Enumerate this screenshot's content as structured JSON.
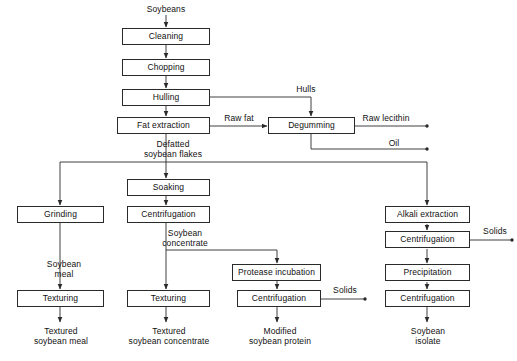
{
  "diagram": {
    "stroke_color": "#2a2a2a",
    "text_color": "#111111",
    "background": "#ffffff",
    "nodes": [
      {
        "id": "cleaning",
        "label": "Cleaning",
        "x": 122,
        "y": 28,
        "w": 88,
        "h": 17
      },
      {
        "id": "chopping",
        "label": "Chopping",
        "x": 122,
        "y": 59,
        "w": 88,
        "h": 17
      },
      {
        "id": "hulling",
        "label": "Hulling",
        "x": 122,
        "y": 89,
        "w": 88,
        "h": 17
      },
      {
        "id": "fat-extraction",
        "label": "Fat extraction",
        "x": 117,
        "y": 117,
        "w": 93,
        "h": 17
      },
      {
        "id": "degumming",
        "label": "Degumming",
        "x": 268,
        "y": 117,
        "w": 87,
        "h": 17
      },
      {
        "id": "soaking",
        "label": "Soaking",
        "x": 127,
        "y": 179,
        "w": 83,
        "h": 17
      },
      {
        "id": "grinding",
        "label": "Grinding",
        "x": 17,
        "y": 206,
        "w": 87,
        "h": 17
      },
      {
        "id": "centrifugation-mid",
        "label": "Centrifugation",
        "x": 127,
        "y": 206,
        "w": 83,
        "h": 17
      },
      {
        "id": "alkali-extraction",
        "label": "Alkali extraction",
        "x": 385,
        "y": 206,
        "w": 85,
        "h": 17
      },
      {
        "id": "centrifugation-r1",
        "label": "Centrifugation",
        "x": 385,
        "y": 231,
        "w": 85,
        "h": 17
      },
      {
        "id": "protease-incubation",
        "label": "Protease incubation",
        "x": 232,
        "y": 264,
        "w": 89,
        "h": 17
      },
      {
        "id": "precipitation",
        "label": "Precipitation",
        "x": 385,
        "y": 264,
        "w": 85,
        "h": 17
      },
      {
        "id": "texturing-left",
        "label": "Texturing",
        "x": 17,
        "y": 290,
        "w": 87,
        "h": 17
      },
      {
        "id": "texturing-mid",
        "label": "Texturing",
        "x": 127,
        "y": 290,
        "w": 83,
        "h": 17
      },
      {
        "id": "centrifugation-prot",
        "label": "Centrifugation",
        "x": 237,
        "y": 290,
        "w": 84,
        "h": 17
      },
      {
        "id": "centrifugation-r2",
        "label": "Centrifugation",
        "x": 385,
        "y": 290,
        "w": 85,
        "h": 17
      }
    ],
    "labels": [
      {
        "id": "soybeans",
        "text": "Soybeans",
        "x": 136,
        "y": 4,
        "w": 60,
        "align": "center"
      },
      {
        "id": "hulls",
        "text": "Hulls",
        "x": 286,
        "y": 84,
        "w": 40,
        "align": "center"
      },
      {
        "id": "raw-fat",
        "text": "Raw fat",
        "x": 215,
        "y": 113,
        "w": 48,
        "align": "center"
      },
      {
        "id": "raw-lecithin",
        "text": "Raw lecithin",
        "x": 355,
        "y": 113,
        "w": 62,
        "align": "center"
      },
      {
        "id": "oil",
        "text": "Oil",
        "x": 380,
        "y": 138,
        "w": 28,
        "align": "center"
      },
      {
        "id": "defatted-soybean-flakes",
        "text": "Defatted\nsoybean flakes",
        "x": 131,
        "y": 139,
        "w": 84,
        "align": "center"
      },
      {
        "id": "soybean-concentrate",
        "text": "Soybean\nconcentrate",
        "x": 145,
        "y": 228,
        "w": 80,
        "align": "center"
      },
      {
        "id": "soybean-meal",
        "text": "Soybean\nmeal",
        "x": 33,
        "y": 259,
        "w": 62,
        "align": "center"
      },
      {
        "id": "solids-protease",
        "text": "Solids",
        "x": 326,
        "y": 285,
        "w": 38,
        "align": "center"
      },
      {
        "id": "solids-alkali",
        "text": "Solids",
        "x": 476,
        "y": 226,
        "w": 38,
        "align": "center"
      },
      {
        "id": "textured-soybean-meal",
        "text": "Textured\nsoybean meal",
        "x": 18,
        "y": 326,
        "w": 86,
        "align": "center"
      },
      {
        "id": "textured-soybean-conc",
        "text": "Textured\nsoybean concentrate",
        "x": 113,
        "y": 326,
        "w": 112,
        "align": "center"
      },
      {
        "id": "modified-soybean-protein",
        "text": "Modified\nsoybean protein",
        "x": 235,
        "y": 326,
        "w": 90,
        "align": "center"
      },
      {
        "id": "soybean-isolate",
        "text": "Soybean\nisolate",
        "x": 385,
        "y": 326,
        "w": 86,
        "align": "center"
      }
    ]
  }
}
